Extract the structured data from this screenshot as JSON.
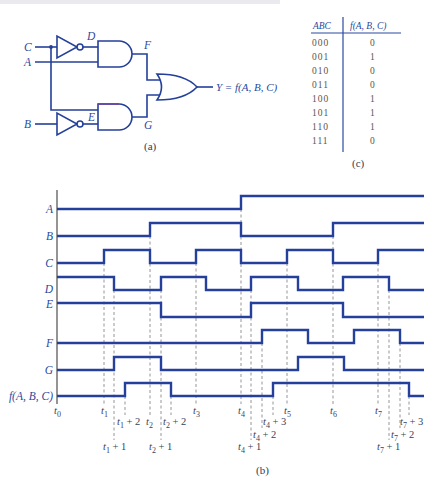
{
  "colors": {
    "signal_blue": "#24409a",
    "label_blue": "#2b4aa0",
    "dashed_gray": "#8a8a8a",
    "axis_gray": "#7a7a7a"
  },
  "circuit": {
    "caption": "(a)",
    "inputs": {
      "C": "C",
      "A": "A",
      "B": "B"
    },
    "nodes": {
      "D": "D",
      "E": "E",
      "F": "F",
      "G": "G"
    },
    "output": "Y = f(A, B, C)",
    "gates": [
      "inverter (C→D)",
      "inverter (B→E)",
      "AND (D,A→F)",
      "AND (C,E→G)",
      "OR (F,G→Y)"
    ]
  },
  "truth_table": {
    "caption": "(c)",
    "headers": {
      "inputs": "ABC",
      "output": "f(A, B, C)"
    },
    "rows": [
      {
        "abc": "000",
        "f": "0"
      },
      {
        "abc": "001",
        "f": "1"
      },
      {
        "abc": "010",
        "f": "0"
      },
      {
        "abc": "011",
        "f": "0"
      },
      {
        "abc": "100",
        "f": "1"
      },
      {
        "abc": "101",
        "f": "1"
      },
      {
        "abc": "110",
        "f": "1"
      },
      {
        "abc": "111",
        "f": "0"
      }
    ]
  },
  "timing": {
    "caption": "(b)",
    "x_start": 57,
    "x_end": 424,
    "signals": [
      {
        "name": "A",
        "label": "A",
        "low": 209,
        "high": 196,
        "label_y": 213,
        "initial": 0,
        "toggles": [
          241
        ]
      },
      {
        "name": "B",
        "label": "B",
        "low": 236,
        "high": 223,
        "label_y": 240,
        "initial": 0,
        "toggles": [
          150,
          241,
          333
        ]
      },
      {
        "name": "C",
        "label": "C",
        "low": 263,
        "high": 250,
        "label_y": 267,
        "initial": 0,
        "toggles": [
          104,
          150,
          196,
          241,
          287,
          333,
          378
        ]
      },
      {
        "name": "D",
        "label": "D",
        "low": 290,
        "high": 277,
        "label_y": 293,
        "initial": 1,
        "toggles": [
          114,
          161,
          206,
          251,
          298,
          343,
          389
        ]
      },
      {
        "name": "E",
        "label": "E",
        "low": 317,
        "high": 303,
        "label_y": 308,
        "initial": 1,
        "toggles": [
          161,
          251,
          343
        ]
      },
      {
        "name": "F",
        "label": "F",
        "low": 343,
        "high": 330,
        "label_y": 347,
        "initial": 0,
        "toggles": [
          262,
          308,
          354,
          400
        ]
      },
      {
        "name": "G",
        "label": "G",
        "low": 370,
        "high": 357,
        "label_y": 374,
        "initial": 0,
        "toggles": [
          114,
          161,
          298,
          344
        ]
      },
      {
        "name": "f",
        "label": "f(A, B, C)",
        "low": 396,
        "high": 383,
        "label_y": 400,
        "initial": 0,
        "toggles": [
          125,
          171,
          273,
          409
        ]
      }
    ],
    "markers": [
      {
        "id": "t0",
        "sub": "0",
        "suffix": "",
        "x": 57,
        "label_x": 54,
        "label_y": 414,
        "y_top": null,
        "y_bot": null
      },
      {
        "id": "t1",
        "sub": "1",
        "suffix": "",
        "x": 104,
        "label_x": 101,
        "label_y": 414,
        "y_top": 252,
        "y_bot": 404
      },
      {
        "id": "t1+1",
        "sub": "1",
        "suffix": " + 1",
        "x": 114,
        "label_x": 103,
        "label_y": 450,
        "y_top": 279,
        "y_bot": 440
      },
      {
        "id": "t1+2",
        "sub": "1",
        "suffix": " + 2",
        "x": 125,
        "label_x": 117,
        "label_y": 425,
        "y_top": 385,
        "y_bot": 415
      },
      {
        "id": "t2",
        "sub": "2",
        "suffix": "",
        "x": 150,
        "label_x": 146,
        "label_y": 425,
        "y_top": 225,
        "y_bot": 415
      },
      {
        "id": "t2+1",
        "sub": "2",
        "suffix": " + 1",
        "x": 161,
        "label_x": 149,
        "label_y": 450,
        "y_top": 279,
        "y_bot": 440
      },
      {
        "id": "t2+2",
        "sub": "2",
        "suffix": " + 2",
        "x": 171,
        "label_x": 163,
        "label_y": 425,
        "y_top": 385,
        "y_bot": 415
      },
      {
        "id": "t3",
        "sub": "3",
        "suffix": "",
        "x": 196,
        "label_x": 193,
        "label_y": 414,
        "y_top": 252,
        "y_bot": 404
      },
      {
        "id": "t4",
        "sub": "4",
        "suffix": "",
        "x": 241,
        "label_x": 238,
        "label_y": 414,
        "y_top": 198,
        "y_bot": 404
      },
      {
        "id": "t4+1",
        "sub": "4",
        "suffix": " + 1",
        "x": 251,
        "label_x": 238,
        "label_y": 450,
        "y_top": 279,
        "y_bot": 440
      },
      {
        "id": "t4+2",
        "sub": "4",
        "suffix": " + 2",
        "x": 262,
        "label_x": 253,
        "label_y": 438,
        "y_top": 332,
        "y_bot": 428
      },
      {
        "id": "t4+3",
        "sub": "4",
        "suffix": " + 3",
        "x": 273,
        "label_x": 263,
        "label_y": 425,
        "y_top": 385,
        "y_bot": 415
      },
      {
        "id": "t5",
        "sub": "5",
        "suffix": "",
        "x": 287,
        "label_x": 284,
        "label_y": 414,
        "y_top": 252,
        "y_bot": 404
      },
      {
        "id": "t6",
        "sub": "6",
        "suffix": "",
        "x": 333,
        "label_x": 330,
        "label_y": 414,
        "y_top": 225,
        "y_bot": 404
      },
      {
        "id": "t7",
        "sub": "7",
        "suffix": "",
        "x": 378,
        "label_x": 375,
        "label_y": 414,
        "y_top": 252,
        "y_bot": 404
      },
      {
        "id": "t7+1",
        "sub": "7",
        "suffix": " + 1",
        "x": 389,
        "label_x": 377,
        "label_y": 450,
        "y_top": 279,
        "y_bot": 440
      },
      {
        "id": "t7+2",
        "sub": "7",
        "suffix": " + 2",
        "x": 400,
        "label_x": 391,
        "label_y": 438,
        "y_top": 332,
        "y_bot": 428
      },
      {
        "id": "t7+3",
        "sub": "7",
        "suffix": " + 3",
        "x": 409,
        "label_x": 400,
        "label_y": 425,
        "y_top": 385,
        "y_bot": 415
      }
    ]
  }
}
